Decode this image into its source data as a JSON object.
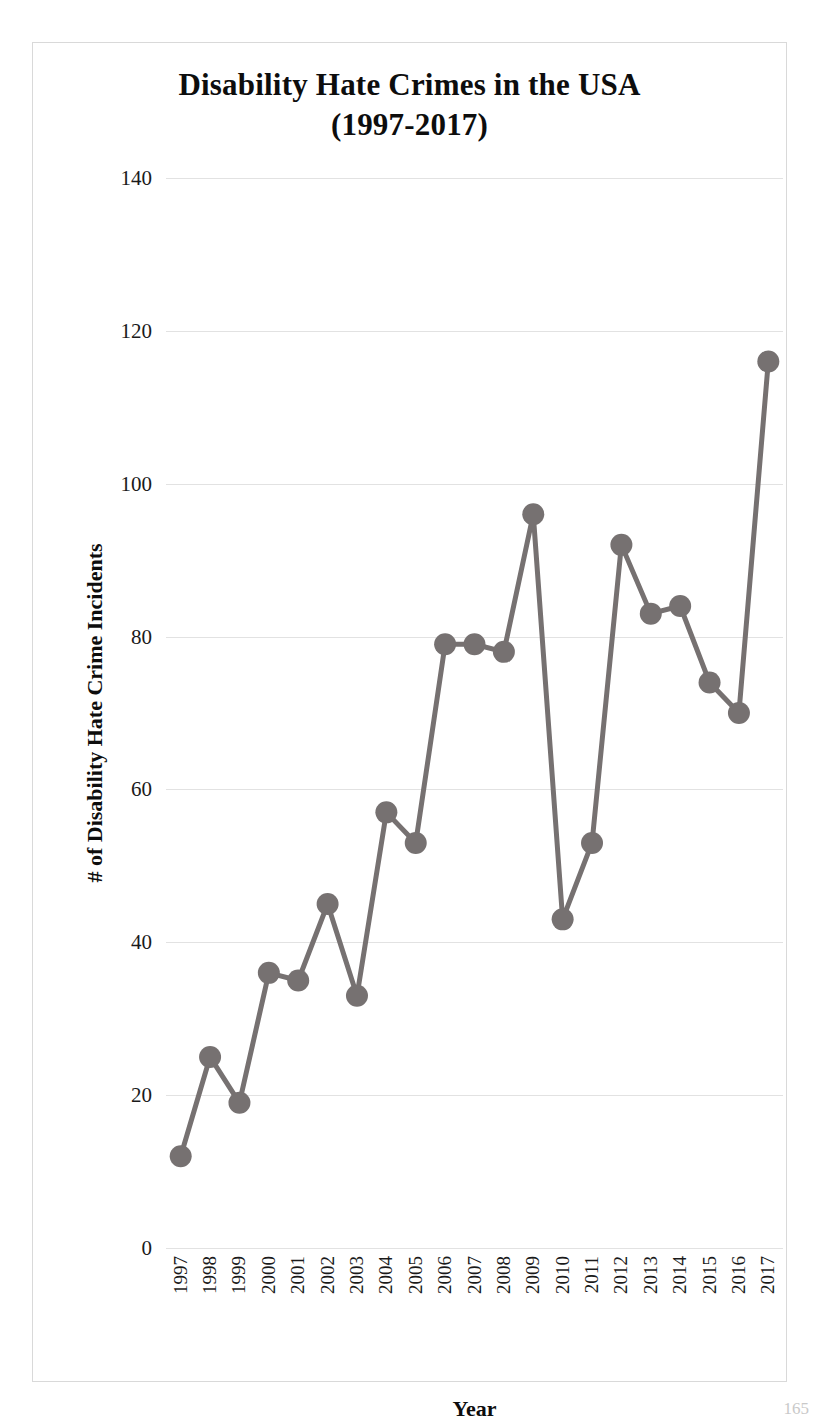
{
  "chart_data": {
    "type": "line",
    "title": "Disability Hate Crimes in the USA (1997-2017)",
    "title_line1": "Disability Hate Crimes in the USA",
    "title_line2": "(1997-2017)",
    "xlabel": "Year",
    "ylabel": "# of Disability Hate Crime Incidents",
    "categories": [
      "1997",
      "1998",
      "1999",
      "2000",
      "2001",
      "2002",
      "2003",
      "2004",
      "2005",
      "2006",
      "2007",
      "2008",
      "2009",
      "2010",
      "2011",
      "2012",
      "2013",
      "2014",
      "2015",
      "2016",
      "2017"
    ],
    "values": [
      12,
      25,
      19,
      36,
      35,
      45,
      33,
      57,
      53,
      79,
      79,
      78,
      96,
      43,
      53,
      92,
      83,
      84,
      74,
      70,
      116
    ],
    "ylim": [
      0,
      140
    ],
    "yticks": [
      0,
      20,
      40,
      60,
      80,
      100,
      120,
      140
    ],
    "ytick_labels": [
      "0",
      "20",
      "40",
      "60",
      "80",
      "100",
      "120",
      "140"
    ],
    "grid": "horizontal",
    "legend": "none",
    "series_color": "#767171",
    "marker": "circle",
    "marker_size": 11,
    "line_width": 5
  },
  "figure": {
    "border_color": "#d9d9d9",
    "background": "#ffffff",
    "page_number": "165"
  }
}
